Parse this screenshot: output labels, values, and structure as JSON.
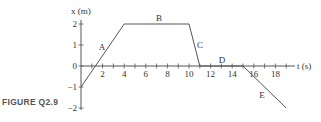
{
  "caption": "FIGURE Q2.9",
  "chart_data": {
    "type": "line",
    "title": "",
    "xlabel": "t (s)",
    "ylabel": "x (m)",
    "xlim": [
      0,
      20
    ],
    "ylim": [
      -2,
      2
    ],
    "x_ticks": [
      2,
      4,
      6,
      8,
      10,
      12,
      14,
      16,
      18
    ],
    "x_tick_labels": [
      "2",
      "4",
      "6",
      "8",
      "10",
      "12",
      "14",
      "16",
      "18"
    ],
    "y_ticks": [
      -2,
      -1,
      0,
      1,
      2
    ],
    "y_tick_labels": [
      "−2",
      "−1",
      "0",
      "1",
      "2"
    ],
    "grid": false,
    "legend": null,
    "series": [
      {
        "name": "x(t)",
        "x": [
          0,
          4,
          10,
          11,
          15,
          19
        ],
        "y": [
          -1,
          2,
          2,
          0,
          0,
          -2
        ]
      }
    ],
    "segments": [
      {
        "label": "A",
        "from": [
          0,
          -1
        ],
        "to": [
          4,
          2
        ]
      },
      {
        "label": "B",
        "from": [
          4,
          2
        ],
        "to": [
          10,
          2
        ]
      },
      {
        "label": "C",
        "from": [
          10,
          2
        ],
        "to": [
          11,
          0
        ]
      },
      {
        "label": "D",
        "from": [
          11,
          0
        ],
        "to": [
          15,
          0
        ]
      },
      {
        "label": "E",
        "from": [
          15,
          0
        ],
        "to": [
          19,
          -2
        ]
      }
    ],
    "colors": {
      "line": "#555555",
      "axis": "#555555",
      "text": "#333333"
    }
  }
}
